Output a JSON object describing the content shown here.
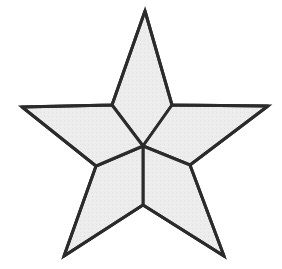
{
  "figure": {
    "shape_name": "star",
    "point_count": 5,
    "segment_count": 5,
    "background_color": "#ffffff",
    "fill_color": "#ececec",
    "stroke_color": "#2b2b2b",
    "stroke_width": 3,
    "canvas": {
      "width": 282,
      "height": 269
    }
  },
  "geometry": {
    "center": {
      "x": 143,
      "y": 146
    },
    "outer_points": [
      {
        "name": "top",
        "x": 145,
        "y": 11
      },
      {
        "name": "right",
        "x": 268,
        "y": 106
      },
      {
        "name": "bottom-right",
        "x": 224,
        "y": 256
      },
      {
        "name": "bottom-left",
        "x": 64,
        "y": 256
      },
      {
        "name": "left",
        "x": 22,
        "y": 107
      }
    ],
    "inner_points": [
      {
        "name": "upper-right",
        "x": 172,
        "y": 105
      },
      {
        "name": "lower-right",
        "x": 190,
        "y": 165
      },
      {
        "name": "bottom",
        "x": 143,
        "y": 205
      },
      {
        "name": "lower-left",
        "x": 96,
        "y": 166
      },
      {
        "name": "upper-left",
        "x": 112,
        "y": 105
      }
    ],
    "outline_path": "M145,11 L172,105 L268,106 L190,165 L224,256 L143,205 L64,256 L96,166 L22,107 L112,105 Z",
    "segments": [
      {
        "name": "segment-top",
        "path": "M143,146 L112,105 L145,11 L172,105 Z"
      },
      {
        "name": "segment-right",
        "path": "M143,146 L172,105 L268,106 L190,165 Z"
      },
      {
        "name": "segment-bottom-right",
        "path": "M143,146 L190,165 L224,256 L143,205 Z"
      },
      {
        "name": "segment-bottom-left",
        "path": "M143,146 L143,205 L64,256 L96,166 Z"
      },
      {
        "name": "segment-left",
        "path": "M143,146 L96,166 L22,107 L112,105 Z"
      }
    ],
    "spokes": [
      {
        "name": "spoke-upper-left",
        "x2": 112,
        "y2": 105
      },
      {
        "name": "spoke-upper-right",
        "x2": 172,
        "y2": 105
      },
      {
        "name": "spoke-lower-right",
        "x2": 190,
        "y2": 165
      },
      {
        "name": "spoke-bottom",
        "x2": 143,
        "y2": 205
      },
      {
        "name": "spoke-lower-left",
        "x2": 96,
        "y2": 166
      }
    ]
  }
}
